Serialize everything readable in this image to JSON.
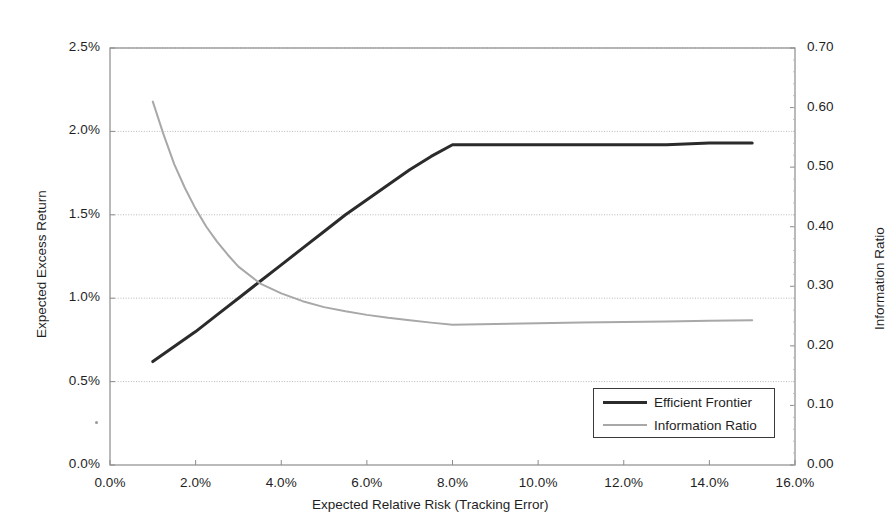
{
  "chart_data": {
    "type": "line",
    "title": "",
    "xlabel": "Expected Relative Risk (Tracking Error)",
    "ylabel": "Expected Excess Return",
    "y2label": "Information Ratio",
    "xlim": [
      0.0,
      16.0
    ],
    "ylim": [
      0.0,
      2.5
    ],
    "y2lim": [
      0.0,
      0.7
    ],
    "grid": true,
    "legend_position": "lower-right",
    "xticks": [
      "0.0%",
      "2.0%",
      "4.0%",
      "6.0%",
      "8.0%",
      "10.0%",
      "12.0%",
      "14.0%",
      "16.0%"
    ],
    "xtick_values": [
      0.0,
      2.0,
      4.0,
      6.0,
      8.0,
      10.0,
      12.0,
      14.0,
      16.0
    ],
    "yticks": [
      "0.0%",
      "0.5%",
      "1.0%",
      "1.5%",
      "2.0%",
      "2.5%"
    ],
    "ytick_values": [
      0.0,
      0.5,
      1.0,
      1.5,
      2.0,
      2.5
    ],
    "y2ticks": [
      "0.00",
      "0.10",
      "0.20",
      "0.30",
      "0.40",
      "0.50",
      "0.60",
      "0.70"
    ],
    "y2tick_values": [
      0.0,
      0.1,
      0.2,
      0.3,
      0.4,
      0.5,
      0.6,
      0.7
    ],
    "series": [
      {
        "name": "Efficient Frontier",
        "axis": "left",
        "color": "#2b2b2b",
        "width": 3,
        "x": [
          1.0,
          1.5,
          2.0,
          2.5,
          3.0,
          3.5,
          4.0,
          4.5,
          5.0,
          5.5,
          6.0,
          6.5,
          7.0,
          7.5,
          8.0,
          8.5,
          9.0,
          10.0,
          11.0,
          12.0,
          13.0,
          14.0,
          15.0
        ],
        "y": [
          0.62,
          0.71,
          0.8,
          0.9,
          1.0,
          1.1,
          1.2,
          1.3,
          1.4,
          1.5,
          1.59,
          1.68,
          1.77,
          1.85,
          1.92,
          1.92,
          1.92,
          1.92,
          1.92,
          1.92,
          1.92,
          1.93,
          1.93
        ]
      },
      {
        "name": "Information Ratio",
        "axis": "right",
        "color": "#a8a8a8",
        "width": 2,
        "x": [
          1.0,
          1.25,
          1.5,
          1.75,
          2.0,
          2.25,
          2.5,
          2.75,
          3.0,
          3.5,
          4.0,
          4.5,
          5.0,
          5.5,
          6.0,
          6.5,
          7.0,
          7.5,
          8.0,
          9.0,
          10.0,
          11.0,
          12.0,
          13.0,
          14.0,
          15.0
        ],
        "y": [
          0.61,
          0.555,
          0.505,
          0.465,
          0.43,
          0.4,
          0.375,
          0.353,
          0.333,
          0.305,
          0.288,
          0.275,
          0.265,
          0.258,
          0.252,
          0.247,
          0.243,
          0.239,
          0.2355,
          0.2365,
          0.238,
          0.239,
          0.24,
          0.241,
          0.242,
          0.243
        ]
      }
    ]
  },
  "legend": {
    "items": [
      {
        "label": "Efficient Frontier"
      },
      {
        "label": "Information Ratio"
      }
    ]
  }
}
